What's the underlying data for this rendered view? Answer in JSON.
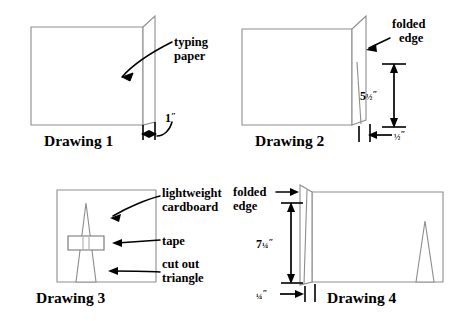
{
  "figure": {
    "panels": [
      {
        "id": "drawing-1",
        "caption": "Drawing 1",
        "annotations": [
          {
            "id": "typing-paper",
            "line1": "typing",
            "line2": "paper"
          }
        ],
        "dimensions": [
          {
            "id": "one-inch",
            "whole": "1",
            "fraction": "",
            "unit": "″"
          }
        ]
      },
      {
        "id": "drawing-2",
        "caption": "Drawing 2",
        "annotations": [
          {
            "id": "folded-edge",
            "line1": "folded",
            "line2": "edge"
          }
        ],
        "dimensions": [
          {
            "id": "five-and-half-inch",
            "whole": "5",
            "fraction": "½",
            "unit": "″"
          },
          {
            "id": "half-inch",
            "whole": "",
            "fraction": "½",
            "unit": "″"
          }
        ]
      },
      {
        "id": "drawing-3",
        "caption": "Drawing 3",
        "annotations": [
          {
            "id": "lightweight-cardboard",
            "line1": "lightweight",
            "line2": "cardboard"
          },
          {
            "id": "tape",
            "line1": "tape",
            "line2": ""
          },
          {
            "id": "cut-out-triangle",
            "line1": "cut out",
            "line2": "triangle"
          }
        ],
        "dimensions": []
      },
      {
        "id": "drawing-4",
        "caption": "Drawing 4",
        "annotations": [
          {
            "id": "folded-edge",
            "line1": "folded",
            "line2": "edge"
          }
        ],
        "dimensions": [
          {
            "id": "seven-and-quarter-inch",
            "whole": "7",
            "fraction": "¼",
            "unit": "″"
          },
          {
            "id": "quarter-inch",
            "whole": "",
            "fraction": "¼",
            "unit": "″"
          }
        ]
      }
    ],
    "colors": {
      "background": "#ffffff",
      "paper_stroke": "#8d8d8d",
      "annotation_stroke": "#000000",
      "text": "#000000"
    }
  }
}
